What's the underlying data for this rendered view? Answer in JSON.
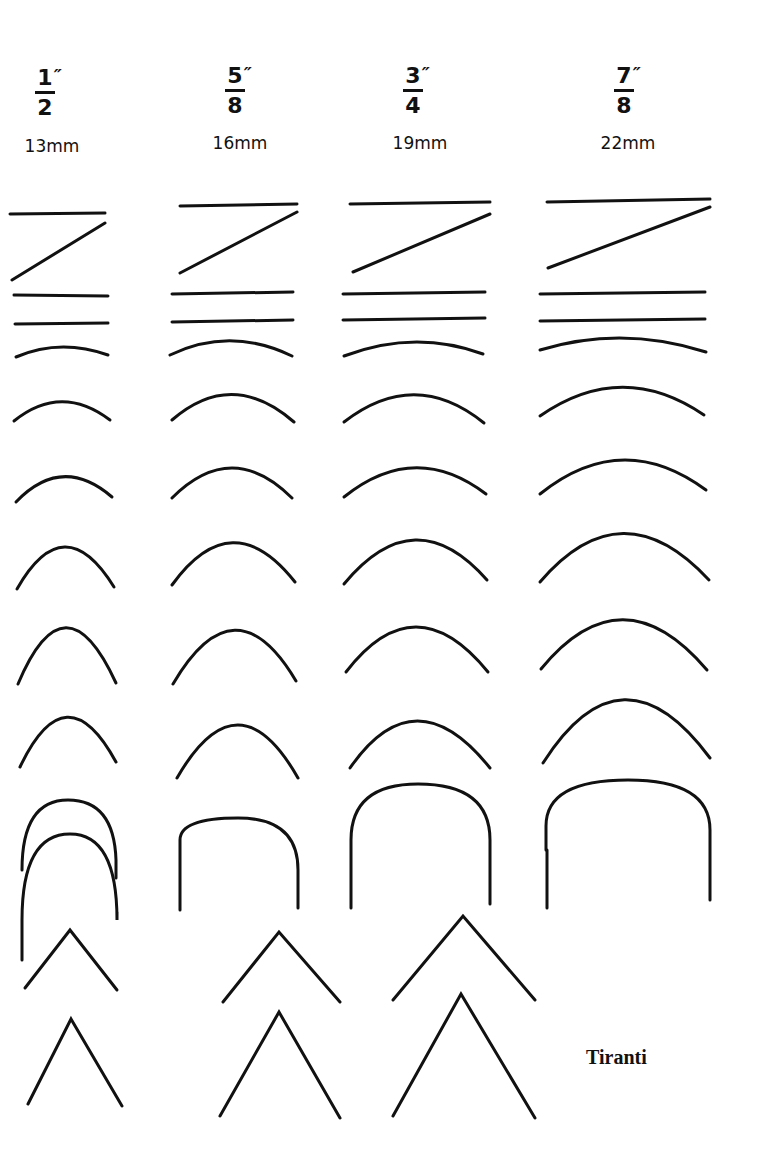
{
  "header": {
    "columns": [
      {
        "inch_num": "1",
        "inch_den": "2",
        "mm": "13mm",
        "x": 45
      },
      {
        "inch_num": "5",
        "inch_den": "8",
        "mm": "16mm",
        "x": 235
      },
      {
        "inch_num": "3",
        "inch_den": "4",
        "mm": "19mm",
        "x": 415
      },
      {
        "inch_num": "7",
        "inch_den": "8",
        "mm": "22mm",
        "x": 622
      }
    ],
    "inch_mark": "″"
  },
  "label": {
    "text": "Tiranti",
    "x": 586,
    "y": 1046
  },
  "style": {
    "stroke": "#111111",
    "stroke_width": 3,
    "background": "#ffffff"
  },
  "profiles": {
    "col_13mm": [
      "M10 214 L105 213",
      "M12 280 L105 223",
      "M14 295 L108 296",
      "M15 324 L108 323",
      "M16 357 Q60 338 108 355",
      "M14 421 Q61 383 110 420",
      "M16 502 Q62 454 112 497",
      "M17 589 Q64 506 114 587",
      "M18 684 Q65 572 116 683",
      "M20 767 Q66 670 116 762",
      "M22 870 Q22 800 68 800 Q114 800 116 860 L116 878",
      "M22 960 L22 920 Q22 834 70 834 Q117 834 117 920 L117 912",
      "M25 988 L70 930 L117 990",
      "M28 1104 L71 1019 L122 1106"
    ],
    "col_16mm": [
      "M180 206 L297 204",
      "M180 273 L297 212",
      "M172 294 L293 292",
      "M172 322 L293 320",
      "M170 355 Q230 326 292 356",
      "M172 420 Q232 368 294 422",
      "M172 498 Q232 438 292 498",
      "M172 585 Q232 502 295 582",
      "M173 684 Q235 578 296 681",
      "M177 778 Q238 672 298 778",
      "M180 910 L180 840 Q180 818 238 818 Q298 818 298 870 L298 908",
      "M223 1002 L279 932 L340 1002",
      "M220 1116 L279 1012 L340 1118"
    ],
    "col_19mm": [
      "M350 204 L490 202",
      "M353 272 L490 214",
      "M343 294 L485 292",
      "M343 320 L485 318",
      "M344 356 Q415 329 483 354",
      "M344 422 Q415 367 484 423",
      "M344 497 Q415 440 486 494",
      "M344 584 Q415 498 487 580",
      "M346 672 Q415 582 488 672",
      "M350 768 Q415 674 490 768",
      "M351 908 L351 840 Q351 784 418 784 Q490 784 490 840 L490 904",
      "M393 1000 L463 916 L535 1000",
      "M393 1116 L461 994 L535 1118"
    ],
    "col_22mm": [
      "M547 202 L710 199",
      "M548 268 L710 207",
      "M540 294 L705 292",
      "M540 321 L705 319",
      "M540 350 Q622 325 706 352",
      "M540 416 Q622 359 704 415",
      "M540 494 Q622 428 706 490",
      "M540 582 Q622 486 709 580",
      "M541 669 Q622 570 707 670",
      "M543 763 Q622 639 710 758",
      "M546 850 L546 826 Q546 780 628 780 Q710 780 710 830 L710 900",
      "M547 908 L547 850"
    ]
  }
}
